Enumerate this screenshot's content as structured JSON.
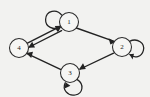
{
  "figure": {
    "type": "directed-graph",
    "title": "",
    "background_color": "#f2f2f0",
    "node_fill_color": "#f6f6f4",
    "stroke_color": "#222222",
    "label_color": "#1d1d1d"
  },
  "nodes": [
    {
      "id": "1",
      "label": "1",
      "cx": 69,
      "cy": 22,
      "r": 9.5,
      "self_loop": true,
      "loop_direction": "upper-left"
    },
    {
      "id": "2",
      "label": "2",
      "cx": 122,
      "cy": 47,
      "r": 9.5,
      "self_loop": true,
      "loop_direction": "right"
    },
    {
      "id": "3",
      "label": "3",
      "cx": 70,
      "cy": 73,
      "r": 9.5,
      "self_loop": true,
      "loop_direction": "lower-right"
    },
    {
      "id": "4",
      "label": "4",
      "cx": 19,
      "cy": 48,
      "r": 9.5,
      "self_loop": false,
      "loop_direction": ""
    }
  ],
  "edges": [
    {
      "from": "1",
      "to": "2",
      "directed": true,
      "style": "straight"
    },
    {
      "from": "2",
      "to": "3",
      "directed": true,
      "style": "straight"
    },
    {
      "from": "3",
      "to": "4",
      "directed": true,
      "style": "straight"
    },
    {
      "from": "1",
      "to": "4",
      "directed": true,
      "style": "parallel-lower"
    },
    {
      "from": "4",
      "to": "1",
      "directed": true,
      "style": "parallel-upper"
    }
  ],
  "self_loops": [
    {
      "node": "1",
      "label": "1"
    },
    {
      "node": "2",
      "label": "2"
    },
    {
      "node": "3",
      "label": "3"
    }
  ]
}
